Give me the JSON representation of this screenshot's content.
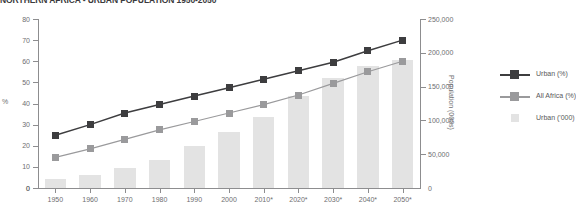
{
  "chart_data": {
    "type": "bar",
    "title": "NORTHERN AFRICA - URBAN POPULATION 1950-2050",
    "xlabel": "",
    "ylabel": "%",
    "ylabel_secondary": "Population (000s)",
    "categories": [
      "1950",
      "1960",
      "1970",
      "1980",
      "1990",
      "2000",
      "2010*",
      "2020*",
      "2030*",
      "2040*",
      "2050*"
    ],
    "ylim": [
      0,
      80
    ],
    "yticks": [
      "0",
      "10",
      "20",
      "30",
      "40",
      "50",
      "60",
      "70",
      "80"
    ],
    "ylim_secondary": [
      0,
      250000
    ],
    "yticks_secondary": [
      "50,000",
      "100,000",
      "150,000",
      "200,000",
      "250,000"
    ],
    "grid": false,
    "legend_position": "right",
    "series": [
      {
        "name": "Urban (%)",
        "type": "line",
        "axis": "left",
        "color": "#3d3d3f",
        "values": [
          25,
          30,
          35.5,
          39.5,
          43.5,
          47.5,
          51.5,
          55.5,
          59.5,
          65,
          70
        ]
      },
      {
        "name": "All Africa (%)",
        "type": "line",
        "axis": "left",
        "color": "#9a9a9c",
        "values": [
          14.5,
          18.5,
          23,
          27.5,
          31.5,
          35.5,
          39.5,
          44,
          49.5,
          55,
          60
        ]
      },
      {
        "name": "Urban ('000)",
        "type": "bar",
        "axis": "right",
        "color": "#e3e3e3",
        "values": [
          13000,
          19000,
          30000,
          42000,
          62000,
          83000,
          105000,
          136000,
          163000,
          180000,
          190000
        ]
      }
    ]
  },
  "legend": {
    "items": [
      {
        "label": "Urban (%)",
        "marker": "line-square",
        "color": "#3d3d3f"
      },
      {
        "label": "All Africa (%)",
        "marker": "line-square",
        "color": "#9a9a9c"
      },
      {
        "label": "Urban ('000)",
        "marker": "filled-square",
        "color": "#e3e3e3"
      }
    ]
  }
}
